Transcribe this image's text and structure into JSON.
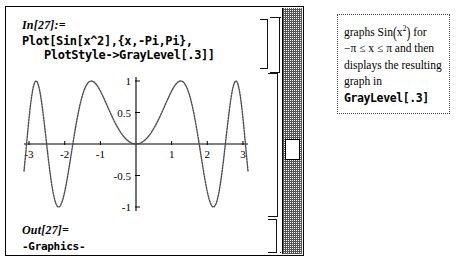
{
  "notebook": {
    "input_cell": {
      "label": "In[27]:=",
      "code_line1": "Plot[Sin[x^2],{x,-Pi,Pi},",
      "code_line2": "PlotStyle->GrayLevel[.3]]"
    },
    "output_cell": {
      "label": "Out[27]=",
      "text": "-Graphics-"
    },
    "scrollbar": {
      "name": "vertical-scrollbar",
      "thumb_label": ""
    }
  },
  "annotation": {
    "line1_pre": "graphs ",
    "line1_fn": "Sin",
    "line1_arg_open": "(",
    "line1_var": "x",
    "line1_exp": "2",
    "line1_arg_close": ")",
    "line1_post": " for",
    "line2": "−π ≤ x ≤ π  and  then",
    "line3": "displays  the  resulting",
    "line4": "graph  in",
    "line5": "GrayLevel[.3]"
  },
  "chart_data": {
    "type": "line",
    "title": "",
    "xlabel": "",
    "ylabel": "",
    "function": "Sin[x^2]",
    "xlim": [
      -3.14159,
      3.14159
    ],
    "ylim": [
      -1,
      1
    ],
    "xticks": [
      -3,
      -2,
      -1,
      1,
      2,
      3
    ],
    "xtick_labels": [
      "-3",
      "-2",
      "-1",
      "1",
      "2",
      "3"
    ],
    "yticks": [
      1,
      0.5,
      -0.5,
      -1
    ],
    "ytick_labels": [
      "1",
      "0.5",
      "-0.5",
      "-1"
    ],
    "grid": false,
    "legend": false,
    "line_color": "#4d4d4d",
    "line_style": "dotted",
    "samples": 260
  }
}
